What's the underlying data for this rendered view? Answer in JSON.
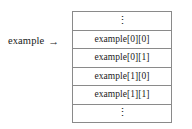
{
  "diagram": {
    "name": "array-memory-layout-diagram",
    "background_color": "#ffffff",
    "border_color": "#8a8a8a",
    "text_color": "#1a1a1a",
    "pointer": {
      "label": "example",
      "arrow_glyph": "→",
      "arrow_icon_name": "right-arrow-icon"
    },
    "table": {
      "cells": [
        {
          "text": "⋮",
          "is_ellipsis": true
        },
        {
          "text": "example[0][0]",
          "is_ellipsis": false
        },
        {
          "text": "example[0][1]",
          "is_ellipsis": false
        },
        {
          "text": "example[1][0]",
          "is_ellipsis": false
        },
        {
          "text": "example[1][1]",
          "is_ellipsis": false
        },
        {
          "text": "⋮",
          "is_ellipsis": true
        }
      ]
    }
  }
}
